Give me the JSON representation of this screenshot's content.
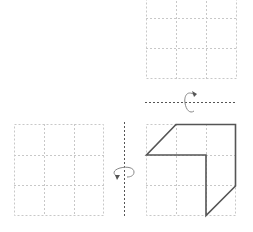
{
  "diagram": {
    "type": "paper-folding-rotation",
    "grid_rows": 3,
    "grid_cols": 3,
    "colors": {
      "grid": "#c8c8c8",
      "shape": "#555555",
      "axis": "#555555",
      "arrow": "#777777"
    },
    "panels": [
      {
        "id": "top-grid",
        "position": "top-right",
        "content": "empty"
      },
      {
        "id": "bottom-left-grid",
        "position": "bottom-left",
        "content": "empty"
      },
      {
        "id": "bottom-right-grid",
        "position": "bottom-right",
        "content": "L-shaped hexagon figure"
      }
    ],
    "axes": [
      {
        "id": "horizontal-axis",
        "orientation": "horizontal",
        "rotation_icon": "rotate-arrow-icon"
      },
      {
        "id": "vertical-axis",
        "orientation": "vertical",
        "rotation_icon": "rotate-arrow-icon"
      }
    ]
  }
}
